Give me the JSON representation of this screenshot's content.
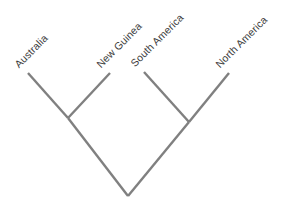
{
  "figure": {
    "type": "cladogram",
    "width": 295,
    "height": 206,
    "background_color": "#ffffff",
    "line_color": "#808080",
    "line_width": 2.4,
    "label_color": "#3d3d3d",
    "label_rotation_deg": -45
  },
  "taxa": [
    {
      "id": "australia",
      "label": "Australia",
      "tip_x": 28,
      "tip_y": 73,
      "label_x": 20,
      "label_y": 70
    },
    {
      "id": "new-guinea",
      "label": "New Guinea",
      "tip_x": 110,
      "tip_y": 73,
      "label_x": 102,
      "label_y": 70
    },
    {
      "id": "south-america",
      "label": "South America",
      "tip_x": 144,
      "tip_y": 72,
      "label_x": 136,
      "label_y": 69
    },
    {
      "id": "north-america",
      "label": "North America",
      "tip_x": 229,
      "tip_y": 73,
      "label_x": 221,
      "label_y": 70
    }
  ],
  "nodes": [
    {
      "id": "node-austral",
      "name": "Australia + New Guinea clade",
      "x": 68,
      "y": 118
    },
    {
      "id": "node-american",
      "name": "South America + North America clade",
      "x": 189,
      "y": 122
    },
    {
      "id": "node-root",
      "name": "root",
      "x": 128,
      "y": 196
    }
  ],
  "branches": [
    {
      "id": "branch-australia",
      "from": "australia",
      "to": "node-austral",
      "path": "M 28 73 L 68 118"
    },
    {
      "id": "branch-new-guinea",
      "from": "new-guinea",
      "to": "node-austral",
      "path": "M 110 73 L 68 118"
    },
    {
      "id": "branch-south-america",
      "from": "south-america",
      "to": "node-american",
      "path": "M 144 72 L 189 122"
    },
    {
      "id": "branch-north-america",
      "from": "north-america",
      "to": "node-american",
      "path": "M 229 73 L 189 122"
    },
    {
      "id": "branch-austral-root",
      "from": "node-austral",
      "to": "node-root",
      "path": "M 68 118 L 128 196"
    },
    {
      "id": "branch-american-root",
      "from": "node-american",
      "to": "node-root",
      "path": "M 189 122 L 128 196"
    }
  ]
}
